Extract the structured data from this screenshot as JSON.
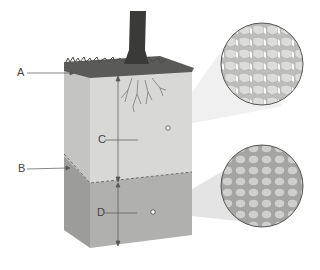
{
  "diagram": {
    "labels": [
      {
        "id": "A",
        "text": "A",
        "points_to": "top surface / organic layer"
      },
      {
        "id": "B",
        "text": "B",
        "points_to": "boundary between upper and lower layers"
      },
      {
        "id": "C",
        "text": "C",
        "points_to": "upper layer thickness"
      },
      {
        "id": "D",
        "text": "D",
        "points_to": "lower layer thickness"
      }
    ],
    "magnifiers": [
      {
        "id": "upper",
        "description": "angular particles with pore spaces"
      },
      {
        "id": "lower",
        "description": "tightly packed rounded particles"
      }
    ],
    "colors": {
      "upper_layer": "#d8d8d6",
      "lower_layer": "#b0b0ae",
      "side_upper": "#c4c4c2",
      "side_lower": "#9c9c9a",
      "grass": "#5a5a58",
      "trunk": "#3a3a38",
      "line": "#555555"
    }
  }
}
